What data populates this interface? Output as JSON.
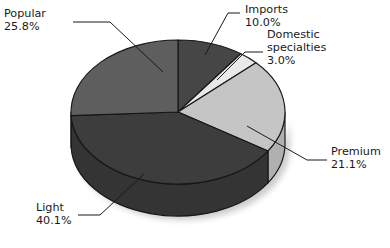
{
  "chart_data": {
    "type": "pie",
    "title": "",
    "subtitle": "",
    "xlabel": "",
    "ylabel": "",
    "legend_position": "none",
    "grid": false,
    "three_d": true,
    "start_angle_deg": 0,
    "direction": "clockwise",
    "units": "percent",
    "categories": [
      "Imports",
      "Domestic specialties",
      "Premium",
      "Light",
      "Popular"
    ],
    "values": [
      10.0,
      21.1,
      3.0,
      40.1,
      25.8
    ],
    "slices": [
      {
        "name": "Imports",
        "label": "Imports",
        "value": 10.0,
        "value_label": "10.0%",
        "color": "#464646",
        "side_color": "#3a3a3a",
        "start_deg": 0.0,
        "end_deg": 36.0
      },
      {
        "name": "Domestic specialties",
        "label": "Domestic\nspecialties",
        "label_line1": "Domestic",
        "label_line2": "specialties",
        "value": 3.0,
        "value_label": "3.0%",
        "color": "#e9e9e9",
        "side_color": "#cfcfcf",
        "start_deg": 36.0,
        "end_deg": 46.8
      },
      {
        "name": "Premium",
        "label": "Premium",
        "value": 21.1,
        "value_label": "21.1%",
        "color": "#c5c5c5",
        "side_color": "#b0b0b0",
        "start_deg": 46.8,
        "end_deg": 122.76
      },
      {
        "name": "Light",
        "label": "Light",
        "value": 40.1,
        "value_label": "40.1%",
        "color": "#3d3d3d",
        "side_color": "#343434",
        "start_deg": 122.76,
        "end_deg": 267.12
      },
      {
        "name": "Popular",
        "label": "Popular",
        "value": 25.8,
        "value_label": "25.8%",
        "color": "#5e5e5e",
        "side_color": "#4e4e4e",
        "start_deg": 267.12,
        "end_deg": 360.0
      }
    ],
    "labels": [
      {
        "key": "popular",
        "lines": [
          "Popular",
          "25.8%"
        ],
        "text_x": 4,
        "text_y": 14,
        "align": "start",
        "leader": "M 73,22 L 110,22 L 163,72"
      },
      {
        "key": "imports",
        "lines": [
          "Imports",
          "10.0%"
        ],
        "text_x": 245,
        "text_y": 10,
        "align": "start",
        "leader": "M 240,13 L 228,13 L 205,55"
      },
      {
        "key": "domestic",
        "lines": [
          "Domestic",
          "specialties",
          "3.0%"
        ],
        "text_x": 267,
        "text_y": 35,
        "align": "start",
        "leader": "M 263,52 L 245,52 L 217,80"
      },
      {
        "key": "premium",
        "lines": [
          "Premium",
          "21.1%"
        ],
        "text_x": 331,
        "text_y": 152,
        "align": "start",
        "leader": "M 327,160 L 307,160 L 247,126"
      },
      {
        "key": "light",
        "lines": [
          "Light",
          "40.1%"
        ],
        "text_x": 36,
        "text_y": 208,
        "align": "start",
        "leader": "M 78,215 L 100,215 L 144,174"
      }
    ],
    "geometry": {
      "center_x": 178,
      "center_y": 112,
      "radius_x": 107,
      "radius_y": 72,
      "depth": 32
    }
  }
}
